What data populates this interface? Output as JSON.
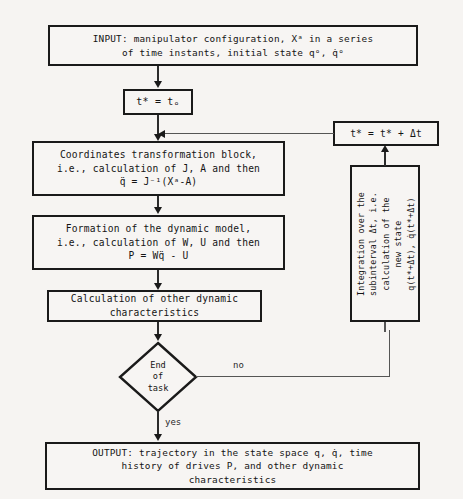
{
  "diagram": {
    "background_color": "#f6f4f2",
    "line_color": "#2b2b2b",
    "box_border_color": "#1a1a1a"
  },
  "nodes": {
    "input": {
      "type": "terminator",
      "line1": "INPUT: manipulator configuration, Xᵃ in a series",
      "line2": "of time instants, initial state qᵒ, q̇ᵒ"
    },
    "init": {
      "type": "process",
      "line1": "t* = tₒ"
    },
    "coords": {
      "type": "process",
      "line1": "Coordinates transformation block,",
      "line2": "i.e., calculation of J, A and then",
      "line3": "q̈ = J⁻¹(Xᵃ-A)"
    },
    "dynmodel": {
      "type": "process",
      "line1": "Formation of the dynamic model,",
      "line2": "i.e., calculation of W, U and then",
      "line3": "P = Wq̈ - U"
    },
    "othercalc": {
      "type": "process",
      "line1": "Calculation of other dynamic",
      "line2": "characteristics"
    },
    "decision": {
      "type": "decision",
      "line1": "End",
      "line2": "of",
      "line3": "task"
    },
    "integration": {
      "type": "process-rotated",
      "line1": "Integration over the",
      "line2": "subinterval Δt, i.e.",
      "line3": "calculation of the",
      "line4": "new state",
      "line5": "q(t*+Δt), q̇(t*+Δt)"
    },
    "tstep": {
      "type": "process",
      "line1": "t* = t* + Δt"
    },
    "output": {
      "type": "terminator",
      "line1": "OUTPUT: trajectory in the state space q, q̇, time",
      "line2": "history of drives P, and other dynamic",
      "line3": "characteristics"
    }
  },
  "edges": {
    "no_label": "no",
    "yes_label": "yes"
  }
}
